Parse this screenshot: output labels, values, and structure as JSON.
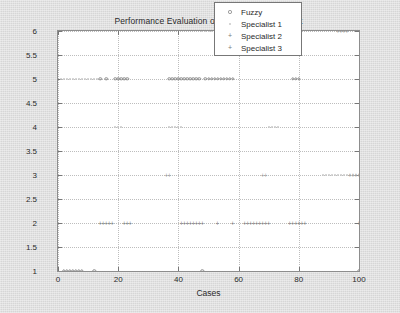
{
  "chart_data": {
    "type": "scatter",
    "title": "Performance Evaluation of ISMp - Overall Result",
    "xlabel": "Cases",
    "ylabel": "Pre-Diagnosis",
    "xlim": [
      0,
      100
    ],
    "ylim": [
      1,
      6
    ],
    "xticks": [
      0,
      20,
      40,
      60,
      80,
      100
    ],
    "yticks": [
      1,
      1.5,
      2,
      2.5,
      3,
      3.5,
      4,
      4.5,
      5,
      5.5,
      6
    ],
    "grid": true,
    "legend_position": "upper-right",
    "series": [
      {
        "name": "Fuzzy",
        "marker": "circle",
        "color": "#8a8a8a",
        "x": [
          2,
          3,
          4,
          5,
          6,
          7,
          8,
          12,
          48,
          100,
          14,
          16,
          19,
          20,
          21,
          22,
          23,
          37,
          38,
          39,
          40,
          41,
          42,
          43,
          44,
          45,
          46,
          47,
          49,
          50,
          51,
          52,
          53,
          54,
          55,
          56,
          57,
          58,
          78,
          79,
          80
        ],
        "y": [
          1,
          1,
          1,
          1,
          1,
          1,
          1,
          1,
          1,
          1,
          5,
          5,
          5,
          5,
          5,
          5,
          5,
          5,
          5,
          5,
          5,
          5,
          5,
          5,
          5,
          5,
          5,
          5,
          5,
          5,
          5,
          5,
          5,
          5,
          5,
          5,
          5,
          5,
          5,
          5,
          5
        ]
      },
      {
        "name": "Specialist 1",
        "marker": "dot",
        "color": "#c9c9c9",
        "x": [
          1,
          2,
          3,
          4,
          5,
          6,
          7,
          8,
          9,
          10,
          11,
          12,
          13,
          19,
          20,
          21,
          37,
          38,
          39,
          40,
          41,
          48,
          49,
          50,
          51,
          52,
          53,
          54,
          55,
          56,
          57,
          58,
          70,
          71,
          72,
          73,
          88,
          89,
          90,
          91,
          92,
          93,
          94,
          95,
          96,
          97,
          98,
          99,
          100
        ],
        "y": [
          5,
          5,
          5,
          5,
          5,
          5,
          5,
          5,
          5,
          5,
          5,
          5,
          5,
          4,
          4,
          4,
          4,
          4,
          4,
          4,
          4,
          6,
          6,
          6,
          6,
          6,
          6,
          6,
          6,
          6,
          6,
          6,
          4,
          4,
          4,
          4,
          3,
          3,
          3,
          3,
          3,
          3,
          3,
          3,
          3,
          3,
          3,
          3,
          3
        ]
      },
      {
        "name": "Specialist 2",
        "marker": "plus",
        "color": "#7a7a7a",
        "x": [
          14,
          15,
          16,
          17,
          18,
          22,
          23,
          24,
          41,
          42,
          43,
          44,
          45,
          46,
          47,
          48,
          53,
          58,
          62,
          63,
          64,
          65,
          66,
          67,
          68,
          69,
          70,
          77,
          78,
          79,
          80,
          81,
          82,
          100
        ],
        "y": [
          2,
          2,
          2,
          2,
          2,
          2,
          2,
          2,
          2,
          2,
          2,
          2,
          2,
          2,
          2,
          2,
          2,
          2,
          2,
          2,
          2,
          2,
          2,
          2,
          2,
          2,
          2,
          2,
          2,
          2,
          2,
          2,
          2,
          2
        ]
      },
      {
        "name": "Specialist 3",
        "marker": "plus-light",
        "color": "#9a9a9a",
        "x": [
          36,
          37,
          68,
          69,
          93,
          94,
          95,
          96,
          97,
          98,
          99,
          100
        ],
        "y": [
          3,
          3,
          3,
          3,
          6,
          6,
          6,
          6,
          3,
          3,
          3,
          3
        ]
      }
    ]
  },
  "legend": {
    "items": [
      {
        "label": "Fuzzy",
        "marker": "circle"
      },
      {
        "label": "Specialist 1",
        "marker": "dot"
      },
      {
        "label": "Specialist 2",
        "marker": "plus"
      },
      {
        "label": "Specialist 3",
        "marker": "plus"
      }
    ]
  },
  "axes": {
    "y_tick_labels": [
      "6",
      "5.5",
      "5",
      "4.5",
      "4",
      "3.5",
      "3",
      "2.5",
      "2",
      "1.5",
      "1"
    ],
    "x_tick_labels": [
      "0",
      "20",
      "40",
      "60",
      "80",
      "100"
    ]
  }
}
